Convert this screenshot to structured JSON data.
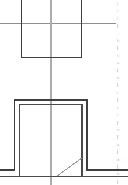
{
  "document": {
    "view_title": "Section Detail",
    "background_color": "#ffffff",
    "line_color_primary": "#3a3a3a",
    "line_color_secondary": "#8a8a8a",
    "line_color_faint": "#c8c8c8",
    "width_px": 128,
    "height_px": 185
  },
  "geometry": {
    "upper_rectangle": {
      "name": "upper-opening-outline",
      "x1": 21.5,
      "y1": 0,
      "x2": 81.5,
      "y2": 57.5,
      "stroke": "#3f3f3f",
      "stroke_width": 1.6
    },
    "horizontal_reference_line": {
      "name": "horizontal-reference-line",
      "x1": 0,
      "y1": 23.5,
      "x2": 116,
      "y2": 23.5,
      "stroke": "#8f8f8f",
      "stroke_width": 1.1
    },
    "vertical_centerline": {
      "name": "vertical-centerline",
      "x1": 51,
      "y1": 0,
      "x2": 51,
      "y2": 185,
      "stroke": "#a8a8a8",
      "stroke_width": 1.1
    },
    "lower_wall_outer": {
      "name": "lower-wall-outer-profile",
      "points": "0,170 14.5,170 14.5,100 87,100 87,170 128,170",
      "stroke": "#3f3f3f",
      "stroke_width": 1.7
    },
    "lower_wall_inner": {
      "name": "lower-wall-inner-profile",
      "points": "0,176.5 19.5,176.5 19.5,104.5 82,104.5 82,176.5 128,176.5",
      "stroke": "#4a4a4a",
      "stroke_width": 1.5
    },
    "diagonal_detail": {
      "name": "diagonal-break-line",
      "x1": 57,
      "y1": 176,
      "x2": 82,
      "y2": 158,
      "stroke": "#9a9a9a",
      "stroke_width": 1.0
    },
    "base_line_lower": {
      "name": "base-ground-line",
      "x1": 0,
      "y1": 176.5,
      "x2": 128,
      "y2": 176.5,
      "stroke": "#4a4a4a",
      "stroke_width": 1.4
    }
  },
  "annotations": {
    "edge_column_label": "cropped-note-column",
    "lines": [
      "|",
      "i",
      "l",
      "|",
      "-",
      "h",
      "|",
      "s",
      "=",
      "l",
      "e",
      "|",
      "r",
      "|",
      "t",
      "i",
      "|",
      "n",
      "|",
      "a",
      "|",
      "d",
      "|",
      "e",
      "|"
    ]
  }
}
